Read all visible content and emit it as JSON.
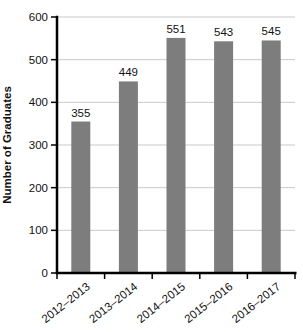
{
  "chart_data": {
    "type": "bar",
    "title": "",
    "categories": [
      "2012–2013",
      "2013–2014",
      "2014–2015",
      "2015–2016",
      "2016–2017"
    ],
    "values": [
      355,
      449,
      551,
      543,
      545
    ],
    "xlabel": "",
    "ylabel": "Number of Graduates",
    "ylim": [
      0,
      600
    ],
    "yticks": [
      0,
      100,
      200,
      300,
      400,
      500,
      600
    ],
    "grid": "horizontal",
    "legend": "none",
    "colors": {
      "bar": "#7d7d7d",
      "grid": "#c9c9c9",
      "axis": "#000000",
      "text": "#111111",
      "background": "#ffffff"
    }
  }
}
